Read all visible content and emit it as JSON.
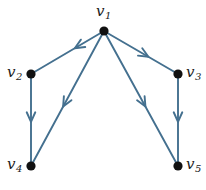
{
  "figure": {
    "background_color": "#ffffff",
    "edge_color": "#44708f",
    "vertex_color": "#111111",
    "label_color": "#1b1b1b",
    "width": 206,
    "height": 190
  },
  "graph": {
    "type": "directed",
    "vertices": [
      {
        "id": "v1",
        "label_base": "v",
        "label_sub": "1",
        "x": 104,
        "y": 31,
        "r": 4.6,
        "label_x": 96,
        "label_y": 4,
        "label_name": "vertex-label-v1"
      },
      {
        "id": "v2",
        "label_base": "v",
        "label_sub": "2",
        "x": 31,
        "y": 74,
        "r": 4.6,
        "label_x": 7,
        "label_y": 65,
        "label_name": "vertex-label-v2"
      },
      {
        "id": "v3",
        "label_base": "v",
        "label_sub": "3",
        "x": 178,
        "y": 74,
        "r": 4.6,
        "label_x": 186,
        "label_y": 65,
        "label_name": "vertex-label-v3"
      },
      {
        "id": "v4",
        "label_base": "v",
        "label_sub": "4",
        "x": 31,
        "y": 166,
        "r": 4.6,
        "label_x": 7,
        "label_y": 157,
        "label_name": "vertex-label-v4"
      },
      {
        "id": "v5",
        "label_base": "v",
        "label_sub": "5",
        "x": 178,
        "y": 166,
        "r": 4.6,
        "label_x": 186,
        "label_y": 157,
        "label_name": "vertex-label-v5"
      }
    ],
    "edges": [
      {
        "id": "e1",
        "from": "v1",
        "to": "v2",
        "x1": 104,
        "y1": 31,
        "x2": 31,
        "y2": 74,
        "arrow_t": 0.4,
        "name": "edge-v1-v2"
      },
      {
        "id": "e2",
        "from": "v1",
        "to": "v3",
        "x1": 104,
        "y1": 31,
        "x2": 178,
        "y2": 74,
        "arrow_t": 0.6,
        "name": "edge-v1-v3"
      },
      {
        "id": "e3",
        "from": "v1",
        "to": "v4",
        "x1": 104,
        "y1": 31,
        "x2": 31,
        "y2": 166,
        "arrow_t": 0.56,
        "name": "edge-v1-v4"
      },
      {
        "id": "e4",
        "from": "v1",
        "to": "v5",
        "x1": 104,
        "y1": 31,
        "x2": 178,
        "y2": 166,
        "arrow_t": 0.56,
        "name": "edge-v1-v5"
      },
      {
        "id": "e5",
        "from": "v2",
        "to": "v4",
        "x1": 31,
        "y1": 74,
        "x2": 31,
        "y2": 166,
        "arrow_t": 0.52,
        "name": "edge-v2-v4"
      },
      {
        "id": "e6",
        "from": "v3",
        "to": "v5",
        "x1": 178,
        "y1": 74,
        "x2": 178,
        "y2": 166,
        "arrow_t": 0.52,
        "name": "edge-v3-v5"
      }
    ]
  }
}
